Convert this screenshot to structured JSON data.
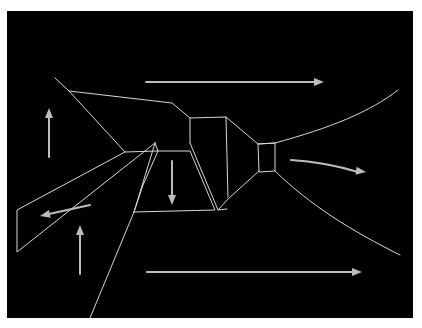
{
  "diagram": {
    "title": "",
    "background_color": "#000000",
    "page_color": "#ffffff",
    "line_color": "#d8d8d8",
    "arrow_color": "#bdbdbd",
    "panel": {
      "x": 7,
      "y": 11,
      "width": 406,
      "height": 307
    },
    "structure_edges": [
      {
        "id": "upper-left-diagonal",
        "points": [
          [
            55,
            78
          ],
          [
            69,
            91
          ],
          [
            125,
            152
          ],
          [
            158,
            151
          ]
        ]
      },
      {
        "id": "roof-line",
        "points": [
          [
            69,
            91
          ],
          [
            172,
            103
          ],
          [
            190,
            118
          ],
          [
            226,
            117
          ],
          [
            258,
            144
          ],
          [
            275,
            143
          ]
        ]
      },
      {
        "id": "upper-flare",
        "type": "curve",
        "points": [
          [
            275,
            143
          ],
          [
            330,
            128
          ],
          [
            370,
            112
          ],
          [
            398,
            90
          ]
        ]
      },
      {
        "id": "lower-flare",
        "type": "curve",
        "points": [
          [
            275,
            171
          ],
          [
            310,
            205
          ],
          [
            350,
            230
          ],
          [
            400,
            255
          ]
        ]
      },
      {
        "id": "left-strip",
        "points": [
          [
            125,
            152
          ],
          [
            17,
            210
          ],
          [
            17,
            252
          ],
          [
            155,
            143
          ]
        ]
      },
      {
        "id": "left-strip-outer",
        "points": [
          [
            155,
            143
          ],
          [
            158,
            151
          ],
          [
            143,
            185
          ],
          [
            134,
            212
          ],
          [
            90,
            318
          ]
        ]
      },
      {
        "id": "trapezoid",
        "points": [
          [
            158,
            151
          ],
          [
            190,
            151
          ],
          [
            215,
            210
          ],
          [
            134,
            212
          ]
        ]
      },
      {
        "id": "trapezoid-inner",
        "points": [
          [
            155,
            143
          ],
          [
            134,
            212
          ]
        ]
      },
      {
        "id": "trapezoid-side",
        "points": [
          [
            190,
            143
          ],
          [
            218,
            210
          ],
          [
            227,
            209
          ]
        ]
      },
      {
        "id": "box-left-vertical",
        "points": [
          [
            190,
            118
          ],
          [
            190,
            143
          ]
        ]
      },
      {
        "id": "box-right-vertical",
        "points": [
          [
            226,
            117
          ],
          [
            228,
            197
          ]
        ]
      },
      {
        "id": "box-bottom",
        "points": [
          [
            218,
            210
          ],
          [
            228,
            199
          ],
          [
            259,
            171
          ]
        ]
      },
      {
        "id": "nozzle-box",
        "points": [
          [
            258,
            144
          ],
          [
            275,
            143
          ],
          [
            275,
            171
          ],
          [
            259,
            172
          ],
          [
            258,
            144
          ]
        ]
      }
    ],
    "flow_arrows": [
      {
        "id": "top-right-arrow",
        "direction": "right",
        "from": [
          146,
          82
        ],
        "to": [
          324,
          82
        ]
      },
      {
        "id": "bottom-right-arrow",
        "direction": "right",
        "from": [
          147,
          272
        ],
        "to": [
          362,
          272
        ]
      },
      {
        "id": "left-up-arrow",
        "direction": "up",
        "from": [
          49,
          157
        ],
        "to": [
          49,
          108
        ]
      },
      {
        "id": "lower-left-up-arrow",
        "direction": "up",
        "from": [
          80,
          274
        ],
        "to": [
          80,
          225
        ]
      },
      {
        "id": "center-down-arrow",
        "direction": "down",
        "from": [
          172,
          161
        ],
        "to": [
          172,
          205
        ]
      },
      {
        "id": "strip-down-left-arrow",
        "direction": "down-left",
        "from": [
          90,
          205
        ],
        "to": [
          40,
          216
        ]
      },
      {
        "id": "exit-curved-arrow",
        "direction": "right",
        "type": "curve",
        "from": [
          291,
          160
        ],
        "to": [
          366,
          172
        ]
      }
    ]
  }
}
